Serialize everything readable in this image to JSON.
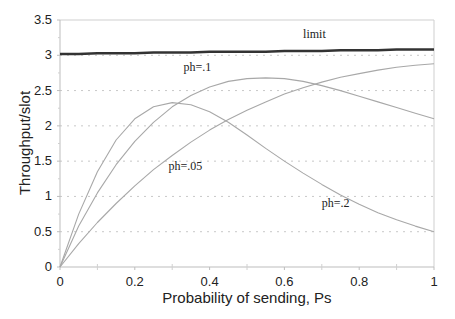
{
  "chart_data": {
    "type": "line",
    "title": "",
    "xlabel": "Probability of sending, Ps",
    "ylabel": "Throughput/slot",
    "xlim": [
      0,
      1
    ],
    "ylim": [
      0,
      3.5
    ],
    "x_ticks": [
      "0",
      "0.2",
      "0.4",
      "0.6",
      "0.8",
      "1"
    ],
    "y_ticks": [
      "0",
      "0.5",
      "1",
      "1.5",
      "2",
      "2.5",
      "3",
      "3.5"
    ],
    "grid": "horizontal dotted",
    "legend": "none (inline annotations)",
    "x": [
      0,
      0.05,
      0.1,
      0.15,
      0.2,
      0.25,
      0.3,
      0.35,
      0.4,
      0.45,
      0.5,
      0.55,
      0.6,
      0.65,
      0.7,
      0.75,
      0.8,
      0.85,
      0.9,
      0.95,
      1.0
    ],
    "series": [
      {
        "name": "limit",
        "label": "limit",
        "values": [
          3.02,
          3.02,
          3.03,
          3.03,
          3.03,
          3.04,
          3.04,
          3.04,
          3.05,
          3.05,
          3.05,
          3.05,
          3.06,
          3.06,
          3.06,
          3.07,
          3.07,
          3.07,
          3.08,
          3.08,
          3.08
        ],
        "style": "thick-dark"
      },
      {
        "name": "ph=.05",
        "label": "ph=.05",
        "values": [
          0,
          0.75,
          1.35,
          1.8,
          2.1,
          2.27,
          2.33,
          2.3,
          2.2,
          2.05,
          1.87,
          1.68,
          1.5,
          1.33,
          1.17,
          1.02,
          0.89,
          0.77,
          0.67,
          0.58,
          0.5
        ]
      },
      {
        "name": "ph=.1",
        "label": "ph=.1",
        "values": [
          0,
          0.58,
          1.05,
          1.45,
          1.78,
          2.05,
          2.27,
          2.43,
          2.55,
          2.63,
          2.67,
          2.68,
          2.67,
          2.63,
          2.57,
          2.5,
          2.42,
          2.34,
          2.26,
          2.18,
          2.1
        ]
      },
      {
        "name": "ph=.2",
        "label": "ph=.2",
        "values": [
          0,
          0.33,
          0.63,
          0.9,
          1.15,
          1.38,
          1.58,
          1.77,
          1.94,
          2.09,
          2.22,
          2.34,
          2.45,
          2.54,
          2.62,
          2.69,
          2.74,
          2.79,
          2.83,
          2.86,
          2.88
        ]
      }
    ],
    "annotations": [
      {
        "text": "limit",
        "x": 0.65,
        "y": 3.25
      },
      {
        "text": "ph=.1",
        "x": 0.33,
        "y": 2.78
      },
      {
        "text": "ph=.05",
        "x": 0.29,
        "y": 1.38
      },
      {
        "text": "ph=.2",
        "x": 0.7,
        "y": 0.85
      }
    ]
  }
}
